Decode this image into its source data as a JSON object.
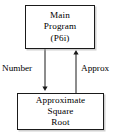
{
  "diagram": {
    "type": "data-flow-diagram",
    "background_color": "#ffffff",
    "stroke_color": "#1a1a1a",
    "text_color": "#000000",
    "nodes": [
      {
        "id": "main-program",
        "shape": "rectangle",
        "lines": [
          "Main",
          "Program",
          "(P6i)"
        ],
        "line1": "Main",
        "line2": "Program",
        "line3": "(P6i)"
      },
      {
        "id": "approximate-square-root",
        "shape": "rectangle",
        "lines": [
          "Approximate",
          "Square",
          "Root"
        ],
        "line1": "Approximate",
        "line2": "Square",
        "line3": "Root"
      }
    ],
    "edges": [
      {
        "id": "number-edge",
        "label": "Number",
        "from": "main-program",
        "to": "approximate-square-root",
        "direction": "down",
        "arrowhead": "filled"
      },
      {
        "id": "approx-edge",
        "label": "Approx",
        "from": "approximate-square-root",
        "to": "main-program",
        "direction": "up",
        "arrowhead": "filled"
      }
    ]
  }
}
